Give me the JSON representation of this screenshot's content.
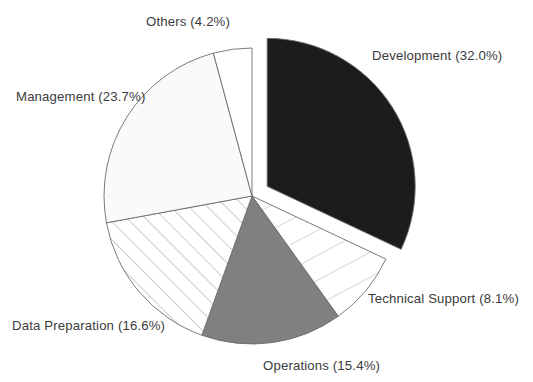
{
  "chart_data": {
    "type": "pie",
    "title": "",
    "subtitle": "",
    "xlabel": "",
    "ylabel": "",
    "legend_position": "none",
    "grid": false,
    "label_format": "{name} ({value}%)",
    "start_angle_deg": 0,
    "direction": "clockwise",
    "categories": [
      "Development",
      "Technical Support",
      "Operations",
      "Data Preparation",
      "Management",
      "Others"
    ],
    "values": [
      32.0,
      8.1,
      15.4,
      16.6,
      23.7,
      4.2
    ],
    "slices": [
      {
        "name": "Development",
        "value": 32.0,
        "label": "Development (32.0%)",
        "fill": "#1c1c1c",
        "pattern": "solid",
        "exploded": true,
        "explode_offset_px": 18,
        "start_deg": 0,
        "end_deg": 115.2,
        "label_x": 372,
        "label_y": 57,
        "label_anchor": "start"
      },
      {
        "name": "Technical Support",
        "value": 8.1,
        "label": "Technical Support (8.1%)",
        "fill": "#ffffff",
        "pattern": "radial-lines",
        "exploded": false,
        "explode_offset_px": 0,
        "start_deg": 115.2,
        "end_deg": 144.36,
        "label_x": 368,
        "label_y": 300,
        "label_anchor": "start"
      },
      {
        "name": "Operations",
        "value": 15.4,
        "label": "Operations (15.4%)",
        "fill": "#808080",
        "pattern": "solid",
        "exploded": false,
        "explode_offset_px": 0,
        "start_deg": 144.36,
        "end_deg": 199.8,
        "label_x": 263,
        "label_y": 367,
        "label_anchor": "start"
      },
      {
        "name": "Data Preparation",
        "value": 16.6,
        "label": "Data Preparation (16.6%)",
        "fill": "#ffffff",
        "pattern": "diagonal-hatch",
        "exploded": false,
        "explode_offset_px": 0,
        "start_deg": 199.8,
        "end_deg": 259.56,
        "label_x": 12,
        "label_y": 327,
        "label_anchor": "start"
      },
      {
        "name": "Management",
        "value": 23.7,
        "label": "Management (23.7%)",
        "fill": "#fafafa",
        "pattern": "solid",
        "exploded": false,
        "explode_offset_px": 0,
        "start_deg": 259.56,
        "end_deg": 344.88,
        "label_x": 16,
        "label_y": 98,
        "label_anchor": "start"
      },
      {
        "name": "Others",
        "value": 4.2,
        "label": "Others (4.2%)",
        "fill": "#ffffff",
        "pattern": "solid",
        "exploded": false,
        "explode_offset_px": 0,
        "start_deg": 344.88,
        "end_deg": 360.0,
        "label_x": 146,
        "label_y": 23,
        "label_anchor": "start"
      }
    ],
    "geometry": {
      "center_x": 252,
      "center_y": 196,
      "radius": 148
    }
  },
  "caption": {
    "partial_text": ""
  }
}
